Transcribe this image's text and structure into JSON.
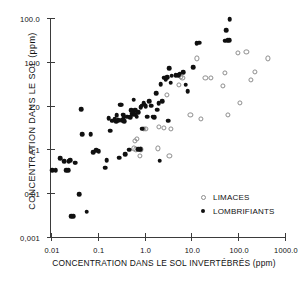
{
  "chart_data": {
    "type": "scatter",
    "title": "",
    "xlabel": "CONCENTRATION  DANS  LE  SOL  INVERTÉBRÉS  (ppm)",
    "ylabel": "CONCENTRATION  DANS  LE  SOL   (ppm)",
    "xscale": "log",
    "yscale": "log",
    "xlim": [
      0.01,
      1000.0
    ],
    "ylim": [
      0.001,
      100.0
    ],
    "grid": false,
    "xticks": [
      0.01,
      0.1,
      1.0,
      10.0,
      100.0,
      1000.0
    ],
    "xtick_labels": [
      "0.01",
      "0.1",
      "1.0",
      "10.0",
      "100.0",
      "1000.0"
    ],
    "yticks": [
      0.001,
      0.01,
      0.1,
      1.0,
      10.0,
      100.0
    ],
    "ytick_labels": [
      "0,001",
      "0,01",
      "0,1",
      "1,0",
      "10,0",
      "100.0"
    ],
    "legend_position": "lower right",
    "series": [
      {
        "name": "LIMACES",
        "marker": "open-circle",
        "color": "#8d8d8d",
        "points": [
          [
            0.62,
            0.155
          ],
          [
            0.68,
            0.17
          ],
          [
            0.6,
            0.105
          ],
          [
            0.66,
            0.1
          ],
          [
            0.78,
            0.072
          ],
          [
            0.82,
            0.1
          ],
          [
            0.95,
            0.3
          ],
          [
            1.05,
            0.3
          ],
          [
            1.9,
            0.105
          ],
          [
            2.0,
            0.32
          ],
          [
            2.6,
            0.31
          ],
          [
            3.0,
            1.75
          ],
          [
            3.4,
            0.072
          ],
          [
            3.6,
            0.3
          ],
          [
            5.5,
            3.0
          ],
          [
            6.0,
            4.5
          ],
          [
            6.4,
            4.3
          ],
          [
            9.5,
            0.62
          ],
          [
            13.0,
            12.0
          ],
          [
            16.0,
            0.5
          ],
          [
            20.0,
            4.2
          ],
          [
            26.0,
            4.3
          ],
          [
            48.0,
            2.8
          ],
          [
            52.0,
            5.6
          ],
          [
            60.0,
            0.62
          ],
          [
            100.0,
            16.0
          ],
          [
            110.0,
            1.15
          ],
          [
            150.0,
            16.5
          ],
          [
            190.0,
            3.9
          ],
          [
            230.0,
            5.8
          ],
          [
            430.0,
            12.0
          ]
        ]
      },
      {
        "name": "LOMBRIFIANTS",
        "marker": "filled-circle",
        "color": "#101010",
        "points": [
          [
            0.0105,
            0.034
          ],
          [
            0.0125,
            0.034
          ],
          [
            0.0155,
            0.062
          ],
          [
            0.019,
            0.054
          ],
          [
            0.021,
            0.034
          ],
          [
            0.023,
            0.034
          ],
          [
            0.024,
            0.054
          ],
          [
            0.026,
            0.056
          ],
          [
            0.027,
            0.003
          ],
          [
            0.03,
            0.003
          ],
          [
            0.032,
            0.05
          ],
          [
            0.034,
            0.05
          ],
          [
            0.04,
            0.0095
          ],
          [
            0.044,
            0.84
          ],
          [
            0.046,
            0.225
          ],
          [
            0.058,
            0.0038
          ],
          [
            0.07,
            0.225
          ],
          [
            0.08,
            0.085
          ],
          [
            0.092,
            0.095
          ],
          [
            0.105,
            0.09
          ],
          [
            0.145,
            0.038
          ],
          [
            0.155,
            0.057
          ],
          [
            0.17,
            0.52
          ],
          [
            0.185,
            0.265
          ],
          [
            0.205,
            0.45
          ],
          [
            0.23,
            0.5
          ],
          [
            0.245,
            0.44
          ],
          [
            0.255,
            0.6
          ],
          [
            0.27,
            0.47
          ],
          [
            0.285,
            0.065
          ],
          [
            0.3,
            1.05
          ],
          [
            0.315,
            1.05
          ],
          [
            0.33,
            0.47
          ],
          [
            0.345,
            0.62
          ],
          [
            0.36,
            0.55
          ],
          [
            0.37,
            0.44
          ],
          [
            0.385,
            0.078
          ],
          [
            0.42,
            0.56
          ],
          [
            0.47,
            0.098
          ],
          [
            0.49,
            0.55
          ],
          [
            0.52,
            0.78
          ],
          [
            0.545,
            0.66
          ],
          [
            0.56,
            0.62
          ],
          [
            0.575,
            0.7
          ],
          [
            0.59,
            1.35
          ],
          [
            0.61,
            0.8
          ],
          [
            0.63,
            0.62
          ],
          [
            0.65,
            0.78
          ],
          [
            0.68,
            0.56
          ],
          [
            0.72,
            0.7
          ],
          [
            0.74,
            0.1
          ],
          [
            0.8,
            0.1
          ],
          [
            0.82,
            0.92
          ],
          [
            0.87,
            1.0
          ],
          [
            0.9,
            0.3
          ],
          [
            0.96,
            1.15
          ],
          [
            1.0,
            1.05
          ],
          [
            1.05,
            0.98
          ],
          [
            1.15,
            0.56
          ],
          [
            1.25,
            1.25
          ],
          [
            1.4,
            1.0
          ],
          [
            1.5,
            0.56
          ],
          [
            1.6,
            0.54
          ],
          [
            1.75,
            1.9
          ],
          [
            1.85,
            0.8
          ],
          [
            2.0,
            1.15
          ],
          [
            2.1,
            0.055
          ],
          [
            2.2,
            3.1
          ],
          [
            2.4,
            1.25
          ],
          [
            2.6,
            4.3
          ],
          [
            2.8,
            4.0
          ],
          [
            3.0,
            4.4
          ],
          [
            3.2,
            0.45
          ],
          [
            3.4,
            7.2
          ],
          [
            3.6,
            3.3
          ],
          [
            3.8,
            4.8
          ],
          [
            4.6,
            4.9
          ],
          [
            5.2,
            5.0
          ],
          [
            5.6,
            5.3
          ],
          [
            6.6,
            5.7
          ],
          [
            7.6,
            3.0
          ],
          [
            8.4,
            2.1
          ],
          [
            11.0,
            7.6
          ],
          [
            13.0,
            27.0
          ],
          [
            14.5,
            27.5
          ],
          [
            52.0,
            30.0
          ],
          [
            56.0,
            52.0
          ],
          [
            60.0,
            31.0
          ],
          [
            64.0,
            31.0
          ],
          [
            66.0,
            95.0
          ]
        ]
      }
    ]
  },
  "legend": {
    "items": [
      {
        "label": "LIMACES",
        "marker": "open-circle"
      },
      {
        "label": "LOMBRIFIANTS",
        "marker": "filled-circle"
      }
    ]
  }
}
